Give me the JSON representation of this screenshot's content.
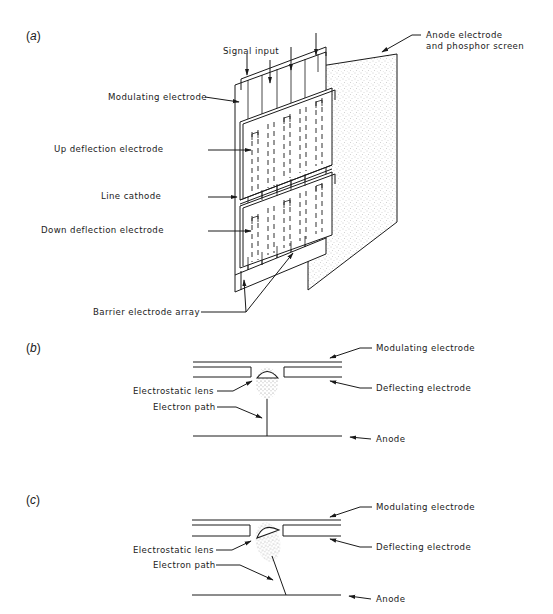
{
  "figure": {
    "panel_a": {
      "label_open": "(",
      "label_letter": "a",
      "label_close": ")",
      "labels": {
        "signal_input": "Signal input",
        "modulating_electrode": "Modulating electrode",
        "up_deflection_electrode": "Up deflection electrode",
        "line_cathode": "Line cathode",
        "down_deflection_electrode": "Down deflection electrode",
        "barrier_electrode_array": "Barrier electrode array",
        "anode_line1": "Anode electrode",
        "anode_line2": "and phosphor screen"
      }
    },
    "panel_b": {
      "label_open": "(",
      "label_letter": "b",
      "label_close": ")",
      "labels": {
        "modulating_electrode": "Modulating electrode",
        "electrostatic_lens": "Electrostatic lens",
        "deflecting_electrode": "Deflecting electrode",
        "electron_path": "Electron path",
        "anode": "Anode"
      }
    },
    "panel_c": {
      "label_open": "(",
      "label_letter": "c",
      "label_close": ")",
      "labels": {
        "modulating_electrode": "Modulating electrode",
        "electrostatic_lens": "Electrostatic lens",
        "deflecting_electrode": "Deflecting electrode",
        "electron_path": "Electron path",
        "anode": "Anode"
      }
    }
  }
}
